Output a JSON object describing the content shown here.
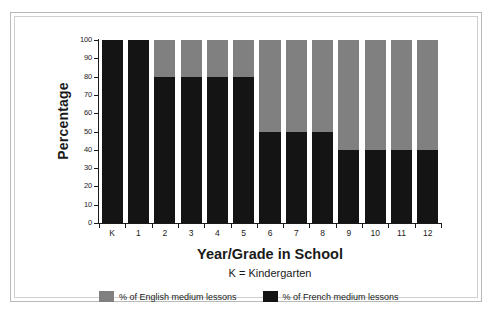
{
  "chart_data": {
    "type": "bar",
    "stacked": true,
    "title": "",
    "xlabel": "Year/Grade in School",
    "xsublabel": "K = Kindergarten",
    "ylabel": "Percentage",
    "ylim": [
      0,
      100
    ],
    "yticks": [
      0,
      10,
      20,
      30,
      40,
      50,
      60,
      70,
      80,
      90,
      100
    ],
    "grid": false,
    "legend_position": "bottom",
    "categories": [
      "K",
      "1",
      "2",
      "3",
      "4",
      "5",
      "6",
      "7",
      "8",
      "9",
      "10",
      "11",
      "12"
    ],
    "series": [
      {
        "name": "% of English medium lessons",
        "color": "#808080",
        "values": [
          0,
          0,
          20,
          20,
          20,
          20,
          50,
          50,
          50,
          60,
          60,
          60,
          60
        ]
      },
      {
        "name": "% of French medium lessons",
        "color": "#141414",
        "values": [
          100,
          100,
          80,
          80,
          80,
          80,
          50,
          50,
          50,
          40,
          40,
          40,
          40
        ]
      }
    ]
  },
  "colors": {
    "english": "#808080",
    "french": "#141414",
    "axis": "#1a1a1a",
    "frame_outer": "#b9b9b9",
    "frame_inner": "#cfcfcf",
    "background": "#ffffff"
  }
}
